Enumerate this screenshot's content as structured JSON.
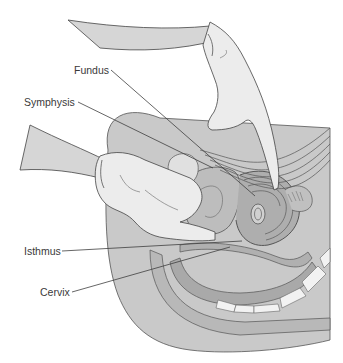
{
  "figure": {
    "colors": {
      "background": "#ffffff",
      "body_shade": "#c9c9c9",
      "tissue_mid": "#b5b5b5",
      "tissue_dark": "#a3a3a3",
      "glove": "#ececec",
      "arm": "#d6d6d6",
      "line": "#3f3f3f",
      "bone": "#f2f2f2"
    },
    "labels": [
      {
        "id": "fundus",
        "text": "Fundus",
        "x": 74,
        "y": 65,
        "line": [
          [
            111,
            70
          ],
          [
            255,
            196
          ]
        ]
      },
      {
        "id": "symphysis",
        "text": "Symphysis",
        "x": 24,
        "y": 97,
        "line": [
          [
            78,
            102
          ],
          [
            213,
            168
          ]
        ]
      },
      {
        "id": "isthmus",
        "text": "Isthmus",
        "x": 24,
        "y": 247,
        "line": [
          [
            62,
            251
          ],
          [
            242,
            241
          ]
        ]
      },
      {
        "id": "cervix",
        "text": "Cervix",
        "x": 40,
        "y": 288,
        "line": [
          [
            72,
            292
          ],
          [
            230,
            247
          ]
        ]
      }
    ]
  }
}
